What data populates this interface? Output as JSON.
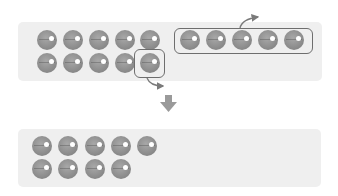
{
  "diagram": {
    "top_panel": {
      "left_group_rows": [
        5,
        5
      ],
      "right_group_count": 5,
      "removed_from_left": 1,
      "removed_group_boxed": true
    },
    "bottom_panel": {
      "rows": [
        5,
        4
      ],
      "total": 9
    },
    "colors": {
      "panel_bg": "#efefef",
      "ball": "#8f8f8f",
      "outline": "#6e6e6e",
      "arrow": "#8a8a8a"
    }
  }
}
